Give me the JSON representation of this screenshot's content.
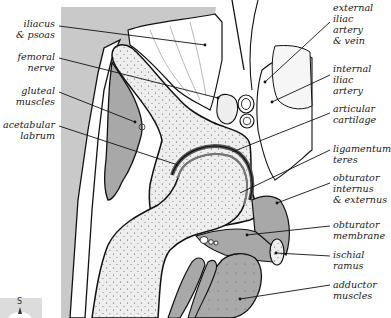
{
  "figure": {
    "labels_left": [
      {
        "text": "iliacus\n& psoas",
        "x": 57,
        "y": 18,
        "target": [
          205,
          45
        ]
      },
      {
        "text": "femoral\nnerve",
        "x": 57,
        "y": 51,
        "target": [
          218,
          98
        ]
      },
      {
        "text": "gluteal\nmuscles",
        "x": 57,
        "y": 85,
        "target": [
          135,
          122
        ]
      },
      {
        "text": "acetabular\nlabrum",
        "x": 57,
        "y": 119,
        "target": [
          178,
          165
        ]
      }
    ],
    "labels_right": [
      {
        "text": "external\niliac\nartery\n& vein",
        "x": 332,
        "y": 2,
        "target": [
          265,
          82
        ]
      },
      {
        "text": "internal\niliac\nartery",
        "x": 332,
        "y": 63,
        "target": [
          272,
          102
        ]
      },
      {
        "text": "articular\ncartilage",
        "x": 332,
        "y": 103,
        "target": [
          232,
          152
        ]
      },
      {
        "text": "ligamentum\nteres",
        "x": 332,
        "y": 143,
        "target": [
          240,
          193
        ]
      },
      {
        "text": "obturator\ninternus\n& externus",
        "x": 332,
        "y": 172,
        "target": [
          277,
          203
        ]
      },
      {
        "text": "obturator\nmembrane",
        "x": 332,
        "y": 219,
        "target": [
          247,
          235
        ]
      },
      {
        "text": "ischial\nramus",
        "x": 332,
        "y": 249,
        "target": [
          276,
          253
        ]
      },
      {
        "text": "adductor\nmuscles",
        "x": 332,
        "y": 279,
        "target": [
          240,
          299
        ]
      }
    ],
    "orientation_marker": {
      "label": "S",
      "icon": "compass-arrow-up"
    },
    "colors": {
      "background": "#ffffff",
      "muscle_grey": "#a8a8a8",
      "outer_grey": "#c9c9c9",
      "bone_stipple": "#e6e6e6",
      "line": "#111111"
    }
  }
}
